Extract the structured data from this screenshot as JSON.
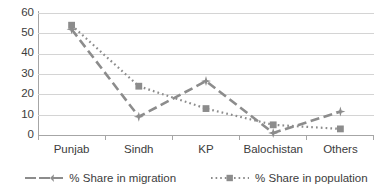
{
  "chart_data": {
    "type": "line",
    "title": "",
    "xlabel": "",
    "ylabel": "",
    "categories": [
      "Punjab",
      "Sindh",
      "KP",
      "Balochistan",
      "Others"
    ],
    "ylim": [
      0,
      60
    ],
    "ytick_step": 10,
    "yticks": [
      "60",
      "50",
      "40",
      "30",
      "20",
      "10",
      "0"
    ],
    "grid": true,
    "legend_position": "bottom",
    "series": [
      {
        "name": "% Share in migration",
        "values": [
          52,
          9,
          26.5,
          1,
          11.5
        ],
        "color": "#8c8c8c",
        "line_style": "dashed",
        "marker": "star"
      },
      {
        "name": "% Share in population",
        "values": [
          54,
          24,
          13,
          5,
          3
        ],
        "color": "#8c8c8c",
        "line_style": "dotted",
        "marker": "square"
      }
    ]
  },
  "colors": {
    "series_gray": "#8c8c8c",
    "gridline": "#d4d4d4",
    "axis": "#a6a6a6",
    "text": "#3c3c3c",
    "background": "#ffffff"
  },
  "legend": {
    "items": [
      {
        "label": "% Share in migration"
      },
      {
        "label": "% Share in population"
      }
    ]
  }
}
